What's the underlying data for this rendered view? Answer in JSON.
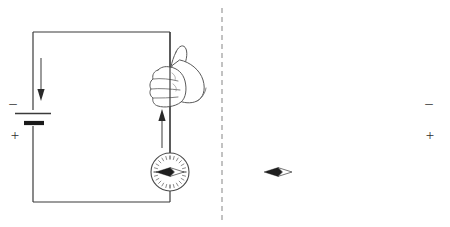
{
  "figure": {
    "background_color": "#ffffff",
    "width": 450,
    "height": 227,
    "divider": {
      "name": "dashed-vertical-divider",
      "style": "dashed",
      "color": "#9a9a9a",
      "x": 222,
      "y_top": 8,
      "y_bottom": 220
    }
  },
  "panels": [
    {
      "id": "left-panel",
      "label": "Left circuit panel",
      "circuit": {
        "left_x": 33,
        "right_x": 170,
        "top_y": 32,
        "bottom_y": 202,
        "wire_color": "#3b3b3b"
      },
      "battery": {
        "name": "battery-symbol",
        "position": "left-wire",
        "x": 33,
        "y": 118,
        "negative_label": "–",
        "positive_label": "+",
        "negative_side": "top",
        "positive_side": "bottom",
        "label_side": "left"
      },
      "current_arrows": [
        {
          "name": "current-arrow-down",
          "direction": "down",
          "x": 41,
          "y_start": 58,
          "y_end": 100,
          "description": "conventional current flowing downward on left wire"
        },
        {
          "name": "current-arrow-up",
          "direction": "up",
          "x": 162,
          "y_start": 148,
          "y_end": 110,
          "description": "conventional current flowing upward on right wire"
        }
      ],
      "hand": {
        "name": "right-hand-grip",
        "side": "right-hand",
        "thumb_direction": "up",
        "grips_wire_at_x": 170,
        "grips_wire_at_y": 72,
        "facing": "right"
      },
      "compass": {
        "name": "compass",
        "center_x": 170,
        "center_y": 172,
        "radius": 19,
        "needle_direction": "left",
        "needle_angle_degrees": 180,
        "tick_count": 24
      }
    },
    {
      "id": "right-panel",
      "label": "Right circuit panel",
      "circuit": {
        "left_x": 278,
        "right_x": 415,
        "top_y": 32,
        "bottom_y": 202,
        "wire_color": "#3b3b3b"
      },
      "battery": {
        "name": "battery-symbol",
        "position": "right-wire",
        "x": 415,
        "y": 118,
        "negative_label": "–",
        "positive_label": "+",
        "negative_side": "top",
        "positive_side": "bottom",
        "label_side": "right"
      },
      "current_arrows": [
        {
          "name": "current-arrow-down",
          "direction": "down",
          "x": 407,
          "y_start": 58,
          "y_end": 100,
          "description": "conventional current flowing downward on right wire"
        },
        {
          "name": "current-arrow-up",
          "direction": "up",
          "x": 286,
          "y_start": 148,
          "y_end": 110,
          "description": "conventional current flowing upward on left wire"
        }
      ],
      "hand": {
        "name": "left-hand-grip",
        "side": "left-hand",
        "thumb_direction": "up",
        "grips_wire_at_x": 278,
        "grips_wire_at_y": 72,
        "facing": "left"
      },
      "compass": {
        "name": "compass",
        "center_x": 278,
        "center_y": 172,
        "radius": 19,
        "needle_direction": "left",
        "needle_angle_degrees": 180,
        "tick_count": 24
      }
    }
  ]
}
